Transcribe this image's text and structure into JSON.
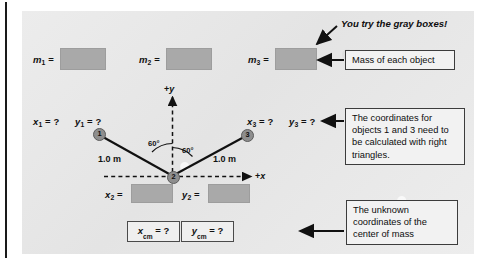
{
  "figure": {
    "note": "You try the gray boxes!"
  },
  "masses": [
    {
      "label_base": "m",
      "label_sub": "1",
      "eq": "="
    },
    {
      "label_base": "m",
      "label_sub": "2",
      "eq": "="
    },
    {
      "label_base": "m",
      "label_sub": "3",
      "eq": "="
    }
  ],
  "coords": {
    "obj1_x": "x",
    "obj1_x_sub": "1",
    "obj1_x_val": "= ?",
    "obj1_y": "y",
    "obj1_y_sub": "1",
    "obj1_y_val": "= ?",
    "obj3_x": "x",
    "obj3_x_sub": "3",
    "obj3_x_val": "= ?",
    "obj3_y": "y",
    "obj3_y_sub": "3",
    "obj3_y_val": "= ?",
    "obj2_x": "x",
    "obj2_x_sub": "2",
    "obj2_x_eq": "=",
    "obj2_y": "y",
    "obj2_y_sub": "2",
    "obj2_y_eq": "="
  },
  "center_of_mass": {
    "x_base": "x",
    "x_sub": "cm",
    "x_val": "= ?",
    "y_base": "y",
    "y_sub": "cm",
    "y_val": "= ?"
  },
  "diagram": {
    "node1": "1",
    "node2": "2",
    "node3": "3",
    "axis_y": "+y",
    "axis_x": "+x",
    "dist_left": "1.0 m",
    "dist_right": "1.0 m",
    "angle_left": "60°",
    "angle_right": "60°"
  },
  "callouts": [
    {
      "id": "mass-callout",
      "text": "Mass of each object"
    },
    {
      "id": "coords-callout",
      "text": "The coordinates for objects 1 and 3 need to be calculated with right triangles."
    },
    {
      "id": "com-callout",
      "text": "The unknown coordinates of the center of mass"
    }
  ],
  "colors": {
    "panel": "#e7e7e7",
    "graybox": "#a9a9a9",
    "ink": "#111111",
    "box_border": "#3c3c3c"
  }
}
